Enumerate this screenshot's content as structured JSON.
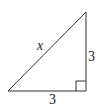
{
  "diagram": {
    "type": "right-triangle",
    "labels": {
      "hypotenuse": "x",
      "vertical_leg": "3",
      "horizontal_leg": "3"
    },
    "right_angle_marker": true,
    "stroke_color": "#333333",
    "text_color": "#222222"
  }
}
